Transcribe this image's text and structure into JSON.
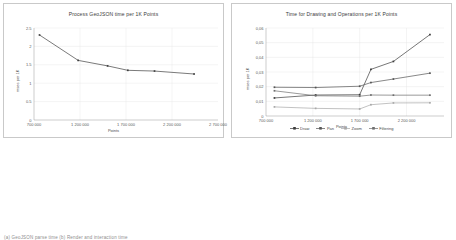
{
  "caption": "(a) GeoJSON parse time          (b) Render and interaction time",
  "panels": [
    {
      "name": "geojson-parse",
      "y_axis_title": "msec per 1K",
      "x_axis_title": "Points"
    },
    {
      "name": "drawing-operations",
      "y_axis_title": "msec per 1K",
      "x_axis_title": "Points"
    }
  ],
  "chart_data": [
    {
      "type": "line",
      "title": "Process GeoJSON time per 1K Points",
      "xlabel": "Points",
      "ylabel": "msec per 1K",
      "xlim": [
        700000,
        2700000
      ],
      "ylim": [
        0,
        2.5
      ],
      "xticks": [
        700000,
        1200000,
        1700000,
        2200000,
        2700000
      ],
      "xtick_labels": [
        "700 000",
        "1 200 000",
        "1 700 000",
        "2 200 000",
        "2 700 000"
      ],
      "yticks": [
        0,
        0.5,
        1,
        1.5,
        2,
        2.5
      ],
      "ytick_labels": [
        "0",
        "0.5",
        "1",
        "1.5",
        "2",
        "2.5"
      ],
      "grid": true,
      "legend": false,
      "series": [
        {
          "name": "Process GeoJSON",
          "color": "#404040",
          "x": [
            760000,
            1180000,
            1500000,
            1720000,
            2010000,
            2440000
          ],
          "values": [
            2.31,
            1.62,
            1.47,
            1.35,
            1.33,
            1.25
          ]
        }
      ]
    },
    {
      "type": "line",
      "title": "Time for Drawing and Operations per 1K Points",
      "xlabel": "Points",
      "ylabel": "msec per 1K",
      "xlim": [
        700000,
        2600000
      ],
      "ylim": [
        0,
        0.06
      ],
      "xticks": [
        700000,
        1200000,
        1700000,
        2200000
      ],
      "xtick_labels": [
        "700 000",
        "1 200 000",
        "1 700 000",
        "2 200 000"
      ],
      "yticks": [
        0,
        0.01,
        0.02,
        0.03,
        0.04,
        0.05,
        0.06
      ],
      "ytick_labels": [
        "0",
        "0,01",
        "0,02",
        "0,03",
        "0,04",
        "0,05",
        "0,06"
      ],
      "grid": true,
      "legend": true,
      "legend_position": "bottom",
      "categories_x": [
        790000,
        1230000,
        1700000,
        1820000,
        2060000,
        2450000
      ],
      "series": [
        {
          "name": "Draw",
          "color": "#3c3c3c",
          "x": [
            790000,
            1230000,
            1700000,
            1820000,
            2060000,
            2450000
          ],
          "values": [
            0.0123,
            0.0143,
            0.0145,
            0.0318,
            0.0372,
            0.0555
          ]
        },
        {
          "name": "Pan",
          "color": "#555555",
          "x": [
            790000,
            1230000,
            1700000,
            1820000,
            2060000,
            2450000
          ],
          "values": [
            0.0196,
            0.0194,
            0.0203,
            0.0228,
            0.0252,
            0.0292
          ]
        },
        {
          "name": "Zoom",
          "color": "#a8a8a8",
          "x": [
            790000,
            1230000,
            1700000,
            1820000,
            2060000,
            2450000
          ],
          "values": [
            0.0062,
            0.0052,
            0.0048,
            0.0077,
            0.0089,
            0.009
          ]
        },
        {
          "name": "Filtering",
          "color": "#6e6e6e",
          "x": [
            790000,
            1230000,
            1700000,
            1820000,
            2060000,
            2450000
          ],
          "values": [
            0.0172,
            0.0138,
            0.0135,
            0.0143,
            0.0142,
            0.0142
          ]
        }
      ]
    }
  ]
}
